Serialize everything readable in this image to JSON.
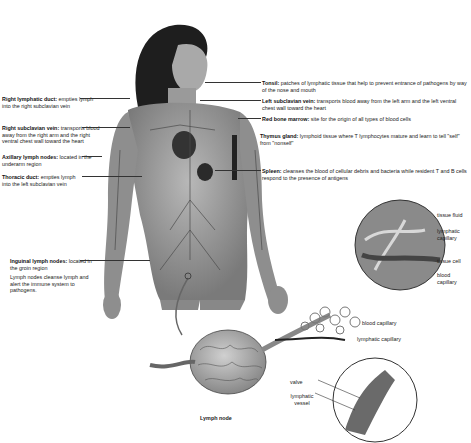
{
  "figure": {
    "left_labels": [
      {
        "id": "right-lymphatic-duct",
        "title": "Right lymphatic duct:",
        "text": "empties lymph into the right subclavian vein"
      },
      {
        "id": "right-subclavian-vein",
        "title": "Right subclavian vein:",
        "text": "transports blood away from the right arm and the right ventral chest wall toward the heart"
      },
      {
        "id": "axillary-lymph-nodes",
        "title": "Axillary lymph nodes:",
        "text": "located in the underarm region"
      },
      {
        "id": "thoracic-duct",
        "title": "Thoracic duct:",
        "text": "empties lymph into the left subclavian vein"
      },
      {
        "id": "inguinal-lymph-nodes",
        "title": "Inguinal lymph nodes:",
        "text": "located in the groin region"
      },
      {
        "id": "lymph-nodes-note",
        "title": "",
        "text": "Lymph nodes cleanse lymph and alert the immune system to pathogens."
      }
    ],
    "right_labels": [
      {
        "id": "tonsil",
        "title": "Tonsil:",
        "text": "patches of lymphatic tissue that help to prevent entrance of pathogens by way of the nose and mouth"
      },
      {
        "id": "left-subclavian-vein",
        "title": "Left subclavian vein:",
        "text": "transports blood away from the left arm and the left ventral chest wall toward the heart"
      },
      {
        "id": "red-bone-marrow",
        "title": "Red bone marrow:",
        "text": "site for the origin of all types of blood cells"
      },
      {
        "id": "thymus-gland",
        "title": "Thymus gland:",
        "text": "lymphoid tissue where T lymphocytes mature and learn to tell \"self\" from \"nonself\""
      },
      {
        "id": "spleen",
        "title": "Spleen:",
        "text": "cleanses the blood of cellular debris and bacteria while resident T and B cells respond to the presence of antigens"
      }
    ],
    "inset_labels": {
      "tissue_fluid": "tissue fluid",
      "lymphatic_capillary": "lymphatic capillary",
      "tissue_cell": "tissue cell",
      "blood_capillary": "blood capillary"
    },
    "bottom_labels": {
      "blood_capillary": "blood capillary",
      "lymphatic_capillary": "lymphatic capillary",
      "valve": "valve",
      "lymphatic_vessel": "lymphatic vessel",
      "lymph_node": "Lymph node"
    }
  }
}
